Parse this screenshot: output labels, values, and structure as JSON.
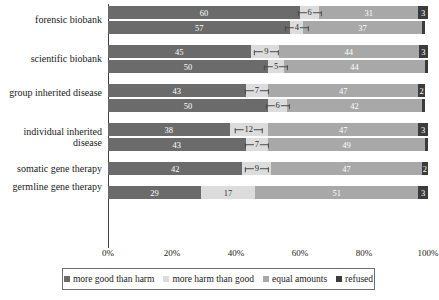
{
  "chart_data": {
    "type": "bar",
    "orientation": "horizontal",
    "stacked": true,
    "normalized_percent": true,
    "title": "",
    "subtitle": "",
    "xlabel": "",
    "ylabel": "",
    "xlim": [
      0,
      100
    ],
    "grid": false,
    "legend_position": "bottom",
    "legend": [
      "more good than harm",
      "more harm than good",
      "equal amounts",
      "refused"
    ],
    "series_colors": [
      "#6b6b6b",
      "#dcdcdc",
      "#a8a8a8",
      "#3b3b3b"
    ],
    "xticks": [
      "0%",
      "20%",
      "40%",
      "60%",
      "80%",
      "100%"
    ],
    "xtick_values": [
      0,
      20,
      40,
      60,
      80,
      100
    ],
    "categories": [
      "forensic biobank",
      "scientific biobank",
      "group inherited disease",
      "individual inherited disease",
      "somatic gene therapy",
      "germline gene therapy"
    ],
    "groups": [
      {
        "category": "forensic biobank",
        "bars": [
          {
            "values": [
              60,
              6,
              31,
              3
            ]
          },
          {
            "values": [
              57,
              4,
              37,
              1
            ]
          }
        ]
      },
      {
        "category": "scientific biobank",
        "bars": [
          {
            "values": [
              45,
              9,
              44,
              3
            ]
          },
          {
            "values": [
              50,
              5,
              44,
              1
            ]
          }
        ]
      },
      {
        "category": "group inherited disease",
        "bars": [
          {
            "values": [
              43,
              7,
              47,
              2
            ]
          },
          {
            "values": [
              50,
              6,
              42,
              1
            ]
          }
        ]
      },
      {
        "category": "individual inherited disease",
        "bars": [
          {
            "values": [
              38,
              12,
              47,
              3
            ]
          },
          {
            "values": [
              43,
              7,
              49,
              1
            ]
          }
        ]
      },
      {
        "category": "somatic gene therapy",
        "bars": [
          {
            "values": [
              42,
              9,
              47,
              2
            ]
          }
        ]
      },
      {
        "category": "germline gene therapy",
        "bars": [
          {
            "values": [
              29,
              17,
              51,
              3
            ]
          }
        ]
      }
    ]
  }
}
